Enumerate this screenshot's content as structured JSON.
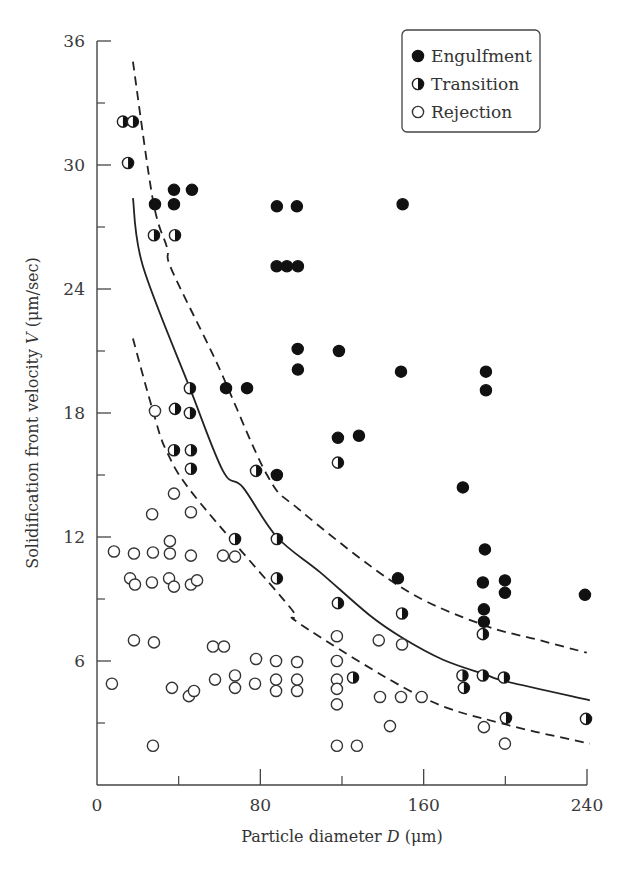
{
  "chart_data": {
    "type": "scatter",
    "title": "",
    "xlabel": "Particle diameter D (μm)",
    "xlabel_parts": {
      "pre": "Particle diameter ",
      "var": "D",
      "post": " (μm)"
    },
    "ylabel": "Solidification front velocity V (μm/sec)",
    "ylabel_parts": {
      "pre": "Solidification front velocity ",
      "var": "V",
      "post": " (μm/sec)"
    },
    "xlim": [
      0,
      240
    ],
    "ylim": [
      0,
      36
    ],
    "x_ticks": [
      0,
      80,
      160,
      240
    ],
    "x_minor_ticks": [
      40,
      120,
      200
    ],
    "y_ticks": [
      0,
      6,
      12,
      18,
      24,
      30,
      36
    ],
    "y_minor_ticks": [
      3,
      9,
      15,
      21,
      27,
      33
    ],
    "grid": false,
    "legend_position": "upper right",
    "legend": [
      {
        "name": "Engulfment",
        "marker": "filled-circle"
      },
      {
        "name": "Transition",
        "marker": "half-filled-circle"
      },
      {
        "name": "Rejection",
        "marker": "open-circle"
      }
    ],
    "series": [
      {
        "name": "Engulfment",
        "marker": "filled",
        "points": [
          [
            37.7,
            28.8
          ],
          [
            46.5,
            28.8
          ],
          [
            28.4,
            28.1
          ],
          [
            37.7,
            28.1
          ],
          [
            88.1,
            28.0
          ],
          [
            97.9,
            28.0
          ],
          [
            149.7,
            28.1
          ],
          [
            88.0,
            25.1
          ],
          [
            93.0,
            25.1
          ],
          [
            98.4,
            25.1
          ],
          [
            98.3,
            21.1
          ],
          [
            98.4,
            20.1
          ],
          [
            118.5,
            21.0
          ],
          [
            148.9,
            20.0
          ],
          [
            190.5,
            20.0
          ],
          [
            190.5,
            19.1
          ],
          [
            63.2,
            19.2
          ],
          [
            73.5,
            19.2
          ],
          [
            118.0,
            16.8
          ],
          [
            128.3,
            16.9
          ],
          [
            88.1,
            15.0
          ],
          [
            179.2,
            14.4
          ],
          [
            190.0,
            11.4
          ],
          [
            147.4,
            10.0
          ],
          [
            189.0,
            9.8
          ],
          [
            199.8,
            9.9
          ],
          [
            199.8,
            9.3
          ],
          [
            189.5,
            8.5
          ],
          [
            189.5,
            7.9
          ],
          [
            239.0,
            9.2
          ]
        ]
      },
      {
        "name": "Transition",
        "marker": "half",
        "points": [
          [
            12.7,
            32.1
          ],
          [
            17.6,
            32.1
          ],
          [
            15.2,
            30.1
          ],
          [
            27.9,
            26.6
          ],
          [
            38.2,
            26.6
          ],
          [
            45.5,
            19.2
          ],
          [
            38.2,
            18.2
          ],
          [
            45.5,
            18.0
          ],
          [
            37.7,
            16.2
          ],
          [
            46.0,
            16.2
          ],
          [
            46.0,
            15.3
          ],
          [
            118.0,
            15.6
          ],
          [
            77.9,
            15.2
          ],
          [
            67.6,
            11.9
          ],
          [
            88.1,
            11.9
          ],
          [
            88.1,
            10.0
          ],
          [
            118.0,
            8.8
          ],
          [
            149.4,
            8.3
          ],
          [
            189.0,
            7.3
          ],
          [
            125.4,
            5.2
          ],
          [
            179.0,
            5.3
          ],
          [
            179.7,
            4.7
          ],
          [
            189.0,
            5.3
          ],
          [
            199.3,
            5.2
          ],
          [
            200.3,
            3.24
          ],
          [
            239.5,
            3.2
          ]
        ]
      },
      {
        "name": "Rejection",
        "marker": "open",
        "points": [
          [
            28.4,
            18.1
          ],
          [
            37.7,
            14.1
          ],
          [
            27.0,
            13.1
          ],
          [
            46.0,
            13.2
          ],
          [
            35.7,
            11.8
          ],
          [
            8.3,
            11.3
          ],
          [
            18.1,
            11.2
          ],
          [
            27.4,
            11.25
          ],
          [
            35.7,
            11.2
          ],
          [
            46.0,
            11.1
          ],
          [
            61.7,
            11.1
          ],
          [
            67.6,
            11.05
          ],
          [
            16.2,
            10.0
          ],
          [
            18.6,
            9.7
          ],
          [
            26.9,
            9.8
          ],
          [
            35.3,
            10.0
          ],
          [
            37.7,
            9.6
          ],
          [
            46.0,
            9.7
          ],
          [
            49.0,
            9.9
          ],
          [
            18.1,
            7.0
          ],
          [
            27.9,
            6.9
          ],
          [
            56.8,
            6.7
          ],
          [
            62.2,
            6.7
          ],
          [
            77.9,
            6.1
          ],
          [
            87.7,
            6.0
          ],
          [
            98.0,
            5.95
          ],
          [
            7.3,
            4.9
          ],
          [
            57.8,
            5.1
          ],
          [
            67.6,
            5.3
          ],
          [
            67.6,
            4.7
          ],
          [
            77.4,
            4.9
          ],
          [
            87.7,
            5.1
          ],
          [
            87.7,
            4.55
          ],
          [
            98.0,
            5.1
          ],
          [
            98.0,
            4.55
          ],
          [
            36.7,
            4.7
          ],
          [
            45.0,
            4.3
          ],
          [
            47.5,
            4.55
          ],
          [
            27.4,
            1.9
          ],
          [
            117.5,
            7.2
          ],
          [
            138.0,
            7.0
          ],
          [
            149.4,
            6.8
          ],
          [
            117.5,
            6.0
          ],
          [
            117.5,
            5.1
          ],
          [
            117.5,
            4.65
          ],
          [
            117.5,
            3.9
          ],
          [
            138.6,
            4.26
          ],
          [
            148.9,
            4.26
          ],
          [
            159.0,
            4.26
          ],
          [
            143.5,
            2.85
          ],
          [
            189.5,
            2.8
          ],
          [
            117.5,
            1.9
          ],
          [
            127.3,
            1.9
          ],
          [
            199.8,
            2.0
          ]
        ]
      }
    ],
    "curves": [
      {
        "name": "upper-bound",
        "style": "dashed",
        "points": [
          [
            17.6,
            35.0
          ],
          [
            27.4,
            28.3
          ],
          [
            34.3,
            26.0
          ],
          [
            36.7,
            24.9
          ],
          [
            58.8,
            20.4
          ],
          [
            83.3,
            15.0
          ],
          [
            99.4,
            13.3
          ],
          [
            148.4,
            9.6
          ],
          [
            187.6,
            7.8
          ],
          [
            217.0,
            7.0
          ],
          [
            239.9,
            6.4
          ]
        ]
      },
      {
        "name": "fit",
        "style": "solid",
        "points": [
          [
            17.6,
            28.4
          ],
          [
            22.5,
            25.1
          ],
          [
            45.5,
            19.2
          ],
          [
            61.7,
            15.2
          ],
          [
            71.5,
            14.4
          ],
          [
            88.1,
            12.0
          ],
          [
            109.2,
            10.3
          ],
          [
            133.7,
            8.2
          ],
          [
            149.9,
            7.1
          ],
          [
            169.5,
            6.06
          ],
          [
            190.0,
            5.35
          ],
          [
            200.8,
            5.0
          ],
          [
            241.4,
            4.1
          ]
        ]
      },
      {
        "name": "lower-bound",
        "style": "dashed",
        "points": [
          [
            17.6,
            21.6
          ],
          [
            27.4,
            18.1
          ],
          [
            34.3,
            16.1
          ],
          [
            48.5,
            13.9
          ],
          [
            94.5,
            8.6
          ],
          [
            99.4,
            7.8
          ],
          [
            158.2,
            4.3
          ],
          [
            197.4,
            3.0
          ],
          [
            241.4,
            2.0
          ]
        ]
      }
    ]
  }
}
